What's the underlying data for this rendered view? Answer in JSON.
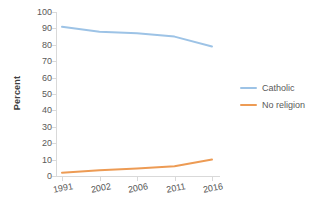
{
  "chart_data": {
    "type": "line",
    "title": "",
    "xlabel": "",
    "ylabel": "Percent",
    "categories": [
      "1991",
      "2002",
      "2006",
      "2011",
      "2016"
    ],
    "series": [
      {
        "name": "Catholic",
        "color": "#9DC3E6",
        "values": [
          91,
          88,
          87,
          85,
          79
        ]
      },
      {
        "name": "No religion",
        "color": "#ED9B54",
        "values": [
          2,
          3.5,
          4.5,
          6,
          10
        ]
      }
    ],
    "ylim": [
      0,
      100
    ],
    "y_ticks": [
      "100",
      "90",
      "80",
      "70",
      "60",
      "50",
      "40",
      "30",
      "20",
      "10",
      "0"
    ],
    "y_tick_values": [
      100,
      90,
      80,
      70,
      60,
      50,
      40,
      30,
      20,
      10,
      0
    ],
    "grid": false,
    "legend_position": "right"
  },
  "axis": {
    "y_title": "Percent"
  },
  "legend": {
    "entries": [
      {
        "label": "Catholic",
        "color": "#9DC3E6"
      },
      {
        "label": "No religion",
        "color": "#ED9B54"
      }
    ]
  }
}
